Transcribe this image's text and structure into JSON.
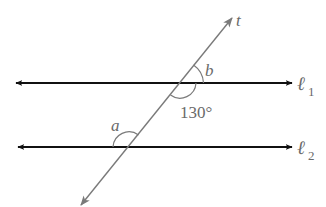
{
  "diagram": {
    "type": "parallel-lines-transversal",
    "colors": {
      "parallel_lines": "#111111",
      "transversal": "#7a7a7a",
      "labels": "#6a6a6a",
      "background": "#ffffff"
    },
    "lines": [
      {
        "id": "l1",
        "label_main": "ℓ",
        "label_sub": "1"
      },
      {
        "id": "l2",
        "label_main": "ℓ",
        "label_sub": "2"
      }
    ],
    "transversal": {
      "label": "t"
    },
    "angles": {
      "a": {
        "label": "a"
      },
      "b": {
        "label": "b"
      },
      "given": {
        "label": "130°"
      }
    }
  }
}
